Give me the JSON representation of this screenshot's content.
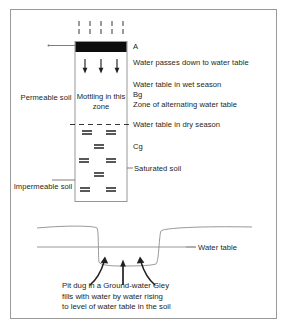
{
  "figure": {
    "title_hidden": "Ground-water Gley soil profile and pit diagram",
    "colors": {
      "line": "#231f20",
      "frame": "#9a9a9a",
      "a_horizon": "#0d0d0d",
      "ground_line": "#8c8c8c",
      "water_table_line": "#8c8c8c",
      "text": "#231f20"
    }
  },
  "column": {
    "mottling_label": "Mottling\nin this\nzone",
    "a_horizon_name": "A-horizon-band",
    "rain_lines": 5,
    "infiltration_arrows": 3,
    "saturation_rows": [
      2,
      1,
      2,
      1,
      2
    ]
  },
  "left_labels": [
    {
      "id": "permeable",
      "text": "Permeable\nsoil"
    },
    {
      "id": "impermeable",
      "text": "Impermeable\nsoil"
    }
  ],
  "right_labels": [
    {
      "id": "a",
      "text": "A"
    },
    {
      "id": "water-passes",
      "text": "Water passes down to water table"
    },
    {
      "id": "wet-season",
      "text": "Water table in wet season"
    },
    {
      "id": "bg",
      "text": "Bg"
    },
    {
      "id": "alternating",
      "text": "Zone of alternating water table"
    },
    {
      "id": "dry-season",
      "text": "Water table in dry season"
    },
    {
      "id": "cg",
      "text": "Cg"
    },
    {
      "id": "saturated",
      "text": "Saturated soil"
    }
  ],
  "pit": {
    "water_table_label": "Water table",
    "caption": "Pit dug in a Ground-water Gley\nfills with water by water rising\nto level of water table in the soil",
    "arrows": 3
  }
}
